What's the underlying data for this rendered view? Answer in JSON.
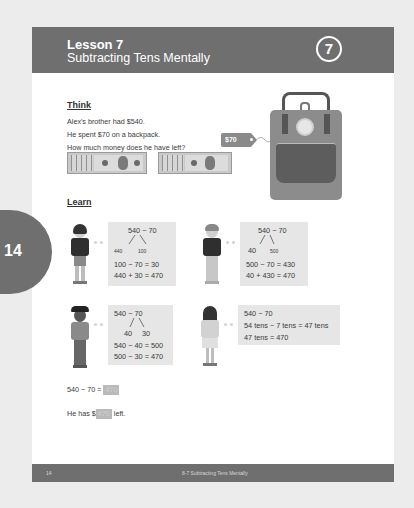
{
  "header": {
    "lesson_number": "Lesson 7",
    "lesson_title": "Subtracting Tens Mentally",
    "lesson_circle": "7"
  },
  "side_badge": {
    "page": "14"
  },
  "think": {
    "heading": "Think",
    "lines": [
      "Alex's brother had $540.",
      "He spent $70 on a backpack.",
      "How much money does he have left?"
    ],
    "price_tag": "$70",
    "illustrations": [
      "money-bills-stack-1",
      "money-bills-stack-2",
      "backpack"
    ]
  },
  "learn": {
    "heading": "Learn",
    "methods": [
      {
        "expression": "540 − 70",
        "split_left": "440",
        "split_right": "100",
        "steps": [
          "100 − 70 = 30",
          "440 + 30 = 470"
        ]
      },
      {
        "expression": "540 − 70",
        "split_left": "40",
        "split_right": "500",
        "steps": [
          "500 − 70 = 430",
          "40 + 430 = 470"
        ]
      },
      {
        "expression": "540 − 70",
        "split_left": "40",
        "split_right": "30",
        "steps": [
          "540 − 40 = 500",
          "500 − 30 = 470"
        ]
      },
      {
        "expression": "540 − 70",
        "steps": [
          "54 tens − 7 tens = 47 tens",
          "47 tens = 470"
        ]
      }
    ]
  },
  "answer": {
    "equation_prefix": "540 − 70 =",
    "equation_answer": "470",
    "sentence_prefix": "He has $",
    "sentence_answer": "470",
    "sentence_suffix": "left."
  },
  "footer": {
    "page_number": "14",
    "title": "8-7  Subtracting Tens Mentally"
  },
  "colors": {
    "background": "#ececec",
    "page": "#ffffff",
    "header_band": "#6f6f6f",
    "box_fill": "#e6e6e6",
    "answer_highlight": "#b9b9b9"
  }
}
